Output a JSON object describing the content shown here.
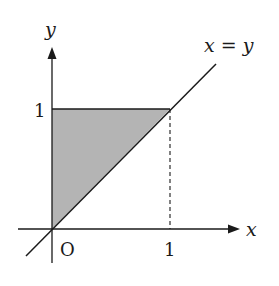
{
  "figure": {
    "axes": {
      "x_label": "x",
      "y_label": "y",
      "origin_label": "O",
      "x_tick_label": "1",
      "y_tick_label": "1"
    },
    "line_label": "x = y",
    "shaded_region": {
      "vertices": [
        [
          0,
          0
        ],
        [
          0,
          1
        ],
        [
          1,
          1
        ]
      ],
      "fill": "#b4b4b4"
    },
    "colors": {
      "stroke": "#1a1a1a",
      "fill": "#b4b4b4",
      "background": "#ffffff"
    }
  }
}
